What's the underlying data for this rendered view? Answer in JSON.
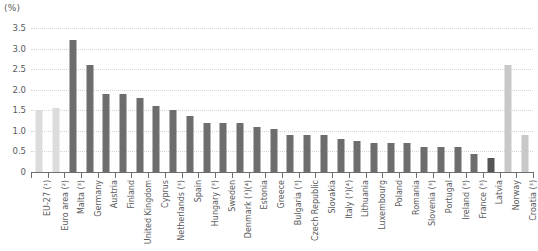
{
  "unit_label": "(%)",
  "chart_data": {
    "type": "bar",
    "title": "",
    "subtitle": "",
    "xlabel": "",
    "ylabel": "(%)",
    "ylim": [
      0,
      3.5
    ],
    "ytick_labels": [
      "0",
      "0.5",
      "1.0",
      "1.5",
      "2.0",
      "2.5",
      "3.0",
      "3.5"
    ],
    "ytick_values": [
      0,
      0.5,
      1.0,
      1.5,
      2.0,
      2.5,
      3.0,
      3.5
    ],
    "grid": true,
    "legend": "none",
    "colors": {
      "aggregate": "#dcdcdc",
      "member_state": "#6d6d6d",
      "highlight": "#555555",
      "non_member": "#c8c8c8",
      "axis": "#6d6e71",
      "gridline": "#d9d3c9",
      "text": "#58595b"
    },
    "categories": [
      "EU-27 (¹)",
      "Euro area (²)",
      "Malta (³)",
      "Germany",
      "Austria",
      "Finland",
      "United Kingdom",
      "Cyprus",
      "Netherlands (³)",
      "Spain",
      "Hungary (³)",
      "Sweden",
      "Denmark (³)(⁴)",
      "Estonia",
      "Greece",
      "Bulgaria (³)",
      "Czech Republic",
      "Slovakia",
      "Italy (³)(⁴)",
      "Lithuania",
      "Luxembourg",
      "Poland",
      "Romania",
      "Slovenia (³)",
      "Portugal",
      "Ireland (³)",
      "France (³)",
      "Latvia",
      "Norway",
      "Croatia (³)"
    ],
    "values": [
      1.5,
      1.55,
      3.2,
      2.6,
      1.9,
      1.9,
      1.8,
      1.6,
      1.5,
      1.35,
      1.2,
      1.2,
      1.2,
      1.1,
      1.05,
      0.9,
      0.9,
      0.9,
      0.8,
      0.75,
      0.7,
      0.7,
      0.7,
      0.6,
      0.6,
      0.6,
      0.45,
      0.35,
      2.6,
      0.9
    ],
    "series_groups": [
      "aggregate",
      "aggregate",
      "member_state",
      "member_state",
      "member_state",
      "member_state",
      "member_state",
      "member_state",
      "member_state",
      "member_state",
      "member_state",
      "member_state",
      "member_state",
      "member_state",
      "member_state",
      "member_state",
      "member_state",
      "member_state",
      "member_state",
      "member_state",
      "member_state",
      "member_state",
      "member_state",
      "member_state",
      "member_state",
      "member_state",
      "member_state",
      "highlight",
      "non_member",
      "non_member"
    ]
  }
}
